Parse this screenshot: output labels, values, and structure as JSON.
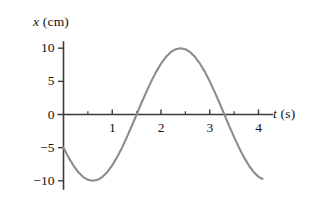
{
  "figure": {
    "name": "position-vs-time-graph",
    "width": 316,
    "height": 201,
    "background_color": "#ffffff"
  },
  "chart_data": {
    "type": "line",
    "title": "",
    "subtitle": "",
    "xlabel": "t (s)",
    "ylabel": "x (cm)",
    "xlabel_parts": {
      "variable": "t",
      "unit": "(s)"
    },
    "ylabel_parts": {
      "variable": "x",
      "unit": "(cm)"
    },
    "xlim": [
      0,
      4.3
    ],
    "ylim": [
      -11.5,
      11.5
    ],
    "grid": false,
    "legend": false,
    "legend_position": "none",
    "curve_color": "#8c8c8c",
    "axis_color": "#3a3a3a",
    "curve_equation": "x = 10 sin(2*pi*(t - 1.667)/4)",
    "amplitude": 10,
    "period": 4,
    "phase_shift_seconds": 1.667,
    "x_major_ticks": [
      1,
      2,
      3,
      4
    ],
    "x_major_tick_labels": [
      "1",
      "2",
      "3",
      "4"
    ],
    "x_minor_ticks": [
      0.5,
      1.5,
      2.5,
      3.5
    ],
    "y_major_ticks": [
      10,
      5,
      0,
      -5,
      -10
    ],
    "y_major_tick_labels": [
      "10",
      "5",
      "0",
      "−5",
      "−10"
    ],
    "key_points": [
      {
        "t": 0.0,
        "x": -5.0,
        "note": "start"
      },
      {
        "t": 0.67,
        "x": -10.0,
        "note": "minimum"
      },
      {
        "t": 1.67,
        "x": 0.0,
        "note": "rising zero crossing"
      },
      {
        "t": 2.67,
        "x": 10.0,
        "note": "maximum"
      },
      {
        "t": 3.67,
        "x": 0.0,
        "note": "falling zero crossing"
      },
      {
        "t": 4.08,
        "x": -6.1,
        "note": "end"
      }
    ],
    "x": [
      0.0,
      0.1,
      0.2,
      0.3,
      0.4,
      0.5,
      0.6,
      0.7,
      0.8,
      0.9,
      1.0,
      1.1,
      1.2,
      1.3,
      1.4,
      1.5,
      1.6,
      1.7,
      1.8,
      1.9,
      2.0,
      2.1,
      2.2,
      2.3,
      2.4,
      2.5,
      2.6,
      2.7,
      2.8,
      2.9,
      3.0,
      3.1,
      3.2,
      3.3,
      3.4,
      3.5,
      3.6,
      3.7,
      3.8,
      3.9,
      4.0,
      4.08
    ],
    "values": [
      -5.0,
      -6.43,
      -7.66,
      -8.66,
      -9.4,
      -9.85,
      -10.0,
      -9.85,
      -9.4,
      -8.66,
      -7.66,
      -6.43,
      -5.0,
      -3.42,
      -1.74,
      0.0,
      1.74,
      3.42,
      5.0,
      6.43,
      7.66,
      8.66,
      9.4,
      9.85,
      10.0,
      9.85,
      9.4,
      8.66,
      7.66,
      6.43,
      5.0,
      3.42,
      1.74,
      0.0,
      -1.74,
      -3.42,
      -5.0,
      -6.43,
      -7.66,
      -8.66,
      -9.4,
      -9.7
    ]
  }
}
